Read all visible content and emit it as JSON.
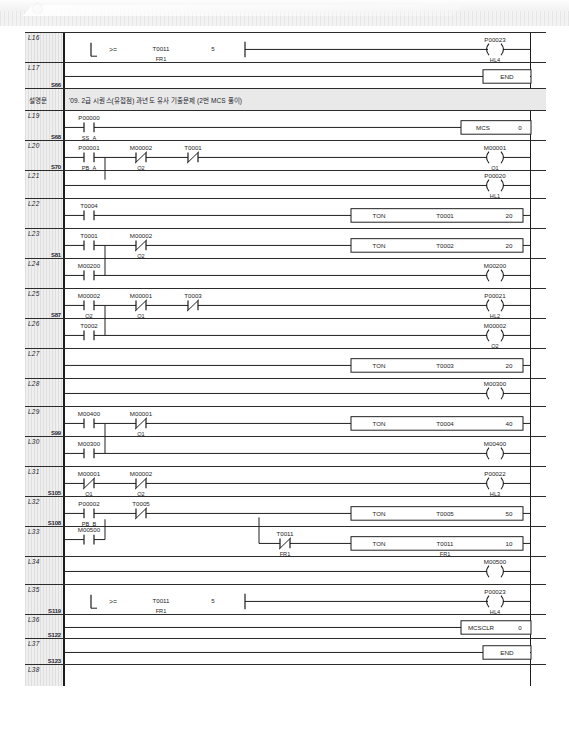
{
  "document": {
    "type": "plc-ladder-diagram",
    "program_title": "LS XG5000 Ladder Program"
  },
  "comment_row": {
    "label": "설명문",
    "text": "'09. 2급  시퀀스(유접점) 과년도 유사 기출문제 (2번 MCS 풀이)"
  },
  "rungs": [
    {
      "line": "L16",
      "step": "",
      "type": "compare",
      "compare_op": ">=",
      "operand1": "T0011",
      "operand1_sub": "FR1",
      "operand2": "5",
      "coil": "P00023",
      "coil_sub": "HL4"
    },
    {
      "line": "L17",
      "step": "S66",
      "type": "end",
      "box": "END"
    },
    {
      "line": "L19",
      "step": "S68",
      "type": "mcs",
      "contacts": [
        {
          "addr": "P00000",
          "sub": "SS_A",
          "kind": "no"
        }
      ],
      "box_name": "MCS",
      "box_value": "0"
    },
    {
      "line": "L20",
      "step": "S70",
      "type": "logic",
      "contacts": [
        {
          "addr": "P00001",
          "sub": "PB_A",
          "kind": "no"
        },
        {
          "addr": "M00002",
          "sub": "Q2",
          "kind": "nc"
        },
        {
          "addr": "T0001",
          "sub": "",
          "kind": "nc"
        }
      ],
      "branch": {
        "addr": "M00001",
        "sub": "Q1",
        "kind": "no"
      },
      "coil": "M00001",
      "coil_sub": "Q1"
    },
    {
      "line": "L21",
      "step": "",
      "type": "coil-only",
      "coil": "P00020",
      "coil_sub": "HL1"
    },
    {
      "line": "L22",
      "step": "",
      "type": "timer",
      "contacts": [
        {
          "addr": "T0004",
          "sub": "",
          "kind": "no"
        }
      ],
      "box_name": "TON",
      "box_target": "T0001",
      "box_value": "20"
    },
    {
      "line": "L23",
      "step": "S81",
      "type": "timer",
      "contacts": [
        {
          "addr": "T0001",
          "sub": "",
          "kind": "no"
        },
        {
          "addr": "M00002",
          "sub": "Q2",
          "kind": "nc"
        }
      ],
      "box_name": "TON",
      "box_target": "T0002",
      "box_value": "20"
    },
    {
      "line": "L24",
      "step": "",
      "type": "logic",
      "branch": {
        "addr": "M00200",
        "sub": "",
        "kind": "no"
      },
      "coil": "M00200",
      "coil_sub": ""
    },
    {
      "line": "L25",
      "step": "S87",
      "type": "logic",
      "contacts": [
        {
          "addr": "M00002",
          "sub": "Q2",
          "kind": "no"
        },
        {
          "addr": "M00001",
          "sub": "Q1",
          "kind": "nc"
        },
        {
          "addr": "T0003",
          "sub": "",
          "kind": "nc"
        }
      ],
      "coil": "P00021",
      "coil_sub": "HL2"
    },
    {
      "line": "L26",
      "step": "",
      "type": "logic",
      "branch": {
        "addr": "T0002",
        "sub": "",
        "kind": "no"
      },
      "coil": "M00002",
      "coil_sub": "Q2"
    },
    {
      "line": "L27",
      "step": "",
      "type": "timer",
      "box_name": "TON",
      "box_target": "T0003",
      "box_value": "20"
    },
    {
      "line": "L28",
      "step": "",
      "type": "coil-only",
      "coil": "M00300",
      "coil_sub": ""
    },
    {
      "line": "L29",
      "step": "S99",
      "type": "timer",
      "contacts": [
        {
          "addr": "M00400",
          "sub": "",
          "kind": "no"
        },
        {
          "addr": "M00001",
          "sub": "Q1",
          "kind": "nc"
        }
      ],
      "box_name": "TON",
      "box_target": "T0004",
      "box_value": "40"
    },
    {
      "line": "L30",
      "step": "",
      "type": "logic",
      "branch": {
        "addr": "M00300",
        "sub": "",
        "kind": "no"
      },
      "coil": "M00400",
      "coil_sub": ""
    },
    {
      "line": "L31",
      "step": "S105",
      "type": "logic",
      "contacts": [
        {
          "addr": "M00001",
          "sub": "Q1",
          "kind": "nc"
        },
        {
          "addr": "M00002",
          "sub": "Q2",
          "kind": "nc"
        }
      ],
      "coil": "P00022",
      "coil_sub": "HL3"
    },
    {
      "line": "L32",
      "step": "S108",
      "type": "timer",
      "contacts": [
        {
          "addr": "P00002",
          "sub": "PB_B",
          "kind": "no"
        },
        {
          "addr": "T0005",
          "sub": "",
          "kind": "nc"
        }
      ],
      "box_name": "TON",
      "box_target": "T0005",
      "box_value": "50"
    },
    {
      "line": "L33",
      "step": "",
      "type": "timer-branch",
      "branch": {
        "addr": "M00500",
        "sub": "",
        "kind": "no"
      },
      "inner_contact": {
        "addr": "T0011",
        "sub": "FR1",
        "kind": "nc"
      },
      "box_name": "TON",
      "box_target": "T0011",
      "box_sub": "FR1",
      "box_value": "10"
    },
    {
      "line": "L34",
      "step": "",
      "type": "coil-only",
      "coil": "M00500",
      "coil_sub": ""
    },
    {
      "line": "L35",
      "step": "S119",
      "type": "compare",
      "compare_op": ">=",
      "operand1": "T0011",
      "operand1_sub": "FR1",
      "operand2": "5",
      "coil": "P00023",
      "coil_sub": "HL4"
    },
    {
      "line": "L36",
      "step": "S122",
      "type": "mcsclr",
      "box_name": "MCSCLR",
      "box_value": "0"
    },
    {
      "line": "L37",
      "step": "S123",
      "type": "end",
      "box": "END"
    },
    {
      "line": "L38",
      "step": "",
      "type": "blank"
    }
  ],
  "colors": {
    "line": "#1c1c1c",
    "gutter": "#e6e6e6",
    "comment_bg": "#e9e9e9",
    "paper": "#ffffff"
  }
}
